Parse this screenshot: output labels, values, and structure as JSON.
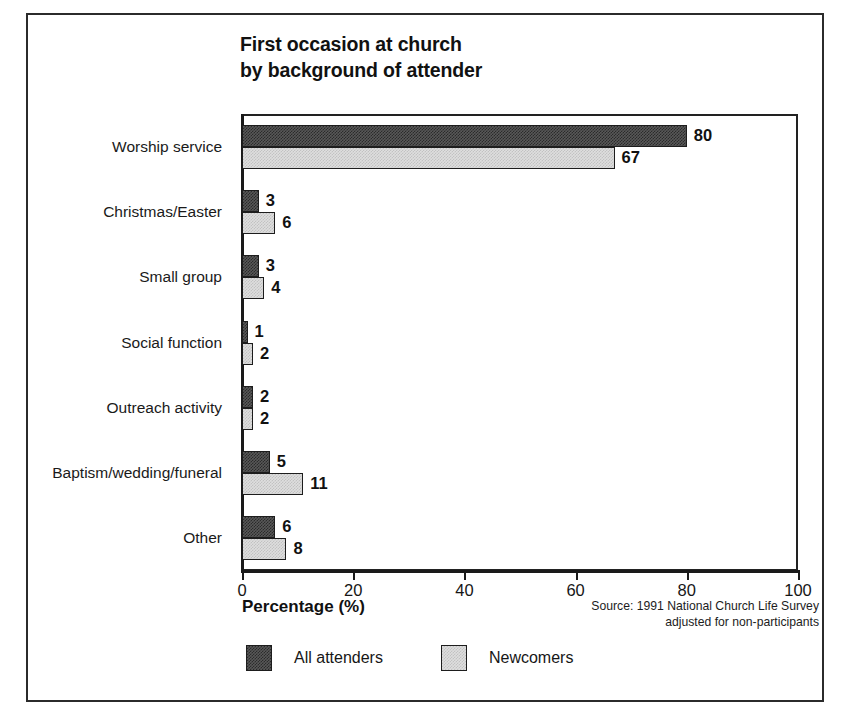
{
  "chart_data": {
    "type": "bar",
    "orientation": "horizontal",
    "title": "First occasion at church\nby background of attender",
    "xlabel": "Percentage (%)",
    "ylabel": "",
    "xlim": [
      0,
      100
    ],
    "xticks": [
      0,
      20,
      40,
      60,
      80,
      100
    ],
    "xtick_labels": [
      "0",
      "20",
      "40",
      "60",
      "80",
      "100"
    ],
    "grid": false,
    "legend_position": "bottom-left",
    "categories": [
      "Worship service",
      "Christmas/Easter",
      "Small group",
      "Social function",
      "Outreach activity",
      "Baptism/wedding/funeral",
      "Other"
    ],
    "series": [
      {
        "name": "All attenders",
        "color": "#585858",
        "values": [
          80,
          3,
          3,
          1,
          2,
          5,
          6
        ],
        "value_labels": [
          "80",
          "3",
          "3",
          "1",
          "2",
          "5",
          "6"
        ]
      },
      {
        "name": "Newcomers",
        "color": "#dedede",
        "values": [
          67,
          6,
          4,
          2,
          2,
          11,
          8
        ],
        "value_labels": [
          "67",
          "6",
          "4",
          "2",
          "2",
          "11",
          "8"
        ]
      }
    ],
    "source_note": "Source: 1991 National Church Life Survey\nadjusted for non-participants"
  }
}
